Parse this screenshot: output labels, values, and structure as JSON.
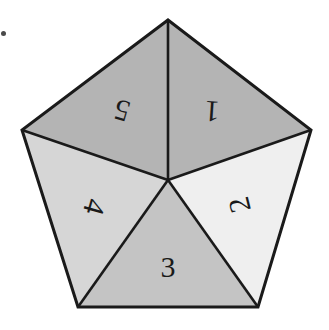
{
  "figure": {
    "background_color": "#ffffff",
    "outline_color": "#1a1a1a",
    "outline_width": 3,
    "divider_color": "#1a1a1a",
    "divider_width": 2.6,
    "center": {
      "x": 168,
      "y": 180
    },
    "vertices": [
      {
        "name": "top",
        "x": 168,
        "y": 20
      },
      {
        "name": "right",
        "x": 311,
        "y": 130
      },
      {
        "name": "bottom-right",
        "x": 258,
        "y": 307
      },
      {
        "name": "bottom-left",
        "x": 78,
        "y": 307
      },
      {
        "name": "left",
        "x": 22,
        "y": 130
      }
    ],
    "sectors": [
      {
        "id": "sector-1",
        "label": "1",
        "fill": "#b4b4b4",
        "position": "top-right",
        "points": "168,20 311,130 168,180",
        "label_x": 212,
        "label_y": 112,
        "label_rotation": 184,
        "font_size": 30
      },
      {
        "id": "sector-2",
        "label": "2",
        "fill": "#efefef",
        "position": "right",
        "points": "311,130 258,307 168,180",
        "label_x": 239,
        "label_y": 205,
        "label_rotation": -104,
        "font_size": 30
      },
      {
        "id": "sector-3",
        "label": "3",
        "fill": "#c4c4c4",
        "position": "bottom",
        "points": "258,307 78,307 168,180",
        "label_x": 168,
        "label_y": 266,
        "label_rotation": 0,
        "font_size": 30
      },
      {
        "id": "sector-4",
        "label": "4",
        "fill": "#d6d6d6",
        "position": "left",
        "points": "78,307 22,130 168,180",
        "label_x": 95,
        "label_y": 207,
        "label_rotation": 106,
        "font_size": 30
      },
      {
        "id": "sector-5",
        "label": "5",
        "fill": "#b4b4b4",
        "position": "top-left",
        "points": "22,130 168,20 168,180",
        "label_x": 122,
        "label_y": 111,
        "label_rotation": 196,
        "font_size": 30
      }
    ],
    "artifacts": [
      {
        "name": "scan-speck",
        "x": 1,
        "y": 31,
        "w": 5,
        "h": 5
      }
    ]
  },
  "chart_data": {
    "type": "pie",
    "subtitle": "",
    "xlabel": "",
    "ylabel": "",
    "legend_position": "none",
    "grid": false,
    "categories": [
      "1",
      "2",
      "3",
      "4",
      "5"
    ],
    "values": [
      20,
      20,
      20,
      20,
      20
    ],
    "slice_colors": [
      "#b4b4b4",
      "#efefef",
      "#c4c4c4",
      "#d6d6d6",
      "#b4b4b4"
    ],
    "annotations": [
      "Sector 1 label rotated approximately 184 degrees",
      "Sector 2 label rotated approximately -104 degrees",
      "Sector 3 label upright at 0 degrees",
      "Sector 4 label rotated approximately 106 degrees",
      "Sector 5 label rotated approximately 196 degrees"
    ]
  }
}
